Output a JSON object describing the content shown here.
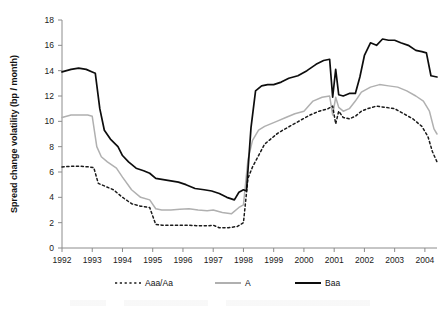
{
  "chart_data": {
    "type": "line",
    "title": "",
    "xlabel": "",
    "ylabel": "Spread change volatility (bp / month)",
    "xlim": [
      1992,
      2004.4
    ],
    "ylim": [
      0,
      18
    ],
    "grid": false,
    "legend_position": "bottom",
    "y_ticks": [
      0,
      2,
      4,
      6,
      8,
      10,
      12,
      14,
      16,
      18
    ],
    "y_tick_labels": [
      "0",
      "2",
      "4",
      "6",
      "8",
      "10",
      "12",
      "14",
      "16",
      "18"
    ],
    "x_ticks": [
      1992,
      1993,
      1994,
      1995,
      1996,
      1997,
      1998,
      1999,
      2000,
      2001,
      2002,
      2003,
      2004
    ],
    "x_tick_labels": [
      "1992",
      "1993",
      "1994",
      "1995",
      "1996",
      "1997",
      "1998",
      "1999",
      "2000",
      "2001",
      "2002",
      "2003",
      "2004"
    ],
    "series": [
      {
        "name": "Aaa/Aa",
        "style": "dotted",
        "color": "#1a1a1a",
        "x": [
          1992.0,
          1992.3,
          1992.6,
          1992.9,
          1993.05,
          1993.2,
          1993.4,
          1993.7,
          1994.0,
          1994.3,
          1994.6,
          1994.9,
          1995.1,
          1995.3,
          1995.6,
          1995.9,
          1996.2,
          1996.5,
          1996.8,
          1997.0,
          1997.2,
          1997.5,
          1997.8,
          1998.0,
          1998.15,
          1998.3,
          1998.5,
          1998.7,
          1998.9,
          1999.1,
          1999.3,
          1999.6,
          1999.9,
          2000.2,
          2000.5,
          2000.8,
          2000.95,
          2001.05,
          2001.15,
          2001.3,
          2001.5,
          2001.7,
          2001.9,
          2002.1,
          2002.4,
          2002.7,
          2003.0,
          2003.3,
          2003.6,
          2003.9,
          2004.1,
          2004.25,
          2004.4
        ],
        "y": [
          6.4,
          6.45,
          6.45,
          6.4,
          6.35,
          5.1,
          4.9,
          4.6,
          4.0,
          3.5,
          3.3,
          3.2,
          1.85,
          1.8,
          1.8,
          1.8,
          1.8,
          1.75,
          1.75,
          1.8,
          1.6,
          1.6,
          1.7,
          2.0,
          5.5,
          6.4,
          7.3,
          8.2,
          8.6,
          9.0,
          9.3,
          9.7,
          10.1,
          10.5,
          10.8,
          11.0,
          11.2,
          9.8,
          10.8,
          10.3,
          10.2,
          10.4,
          10.8,
          11.0,
          11.2,
          11.1,
          11.0,
          10.6,
          10.2,
          9.6,
          8.8,
          7.6,
          6.8
        ]
      },
      {
        "name": "A",
        "style": "solid",
        "color": "#b0b0b0",
        "x": [
          1992.0,
          1992.3,
          1992.6,
          1992.85,
          1993.0,
          1993.15,
          1993.3,
          1993.5,
          1993.8,
          1994.0,
          1994.3,
          1994.6,
          1994.9,
          1995.1,
          1995.3,
          1995.6,
          1995.9,
          1996.2,
          1996.5,
          1996.8,
          1997.0,
          1997.3,
          1997.6,
          1997.85,
          1998.0,
          1998.15,
          1998.3,
          1998.5,
          1998.7,
          1998.9,
          1999.1,
          1999.4,
          1999.7,
          2000.0,
          2000.3,
          2000.6,
          2000.85,
          2000.95,
          2001.05,
          2001.15,
          2001.3,
          2001.5,
          2001.7,
          2001.9,
          2002.2,
          2002.5,
          2002.8,
          2003.1,
          2003.4,
          2003.7,
          2003.95,
          2004.15,
          2004.3,
          2004.4
        ],
        "y": [
          10.3,
          10.5,
          10.5,
          10.5,
          10.4,
          8.0,
          7.2,
          6.8,
          6.3,
          5.6,
          4.6,
          4.0,
          3.8,
          3.1,
          3.0,
          3.0,
          3.05,
          3.1,
          3.0,
          2.95,
          3.0,
          2.8,
          2.7,
          3.2,
          3.4,
          7.0,
          8.5,
          9.3,
          9.6,
          9.8,
          10.0,
          10.3,
          10.6,
          10.8,
          11.6,
          11.9,
          12.0,
          10.5,
          11.9,
          11.1,
          10.8,
          11.0,
          11.6,
          12.3,
          12.7,
          12.9,
          12.8,
          12.7,
          12.4,
          12.0,
          11.6,
          10.8,
          9.4,
          9.0
        ]
      },
      {
        "name": "Baa",
        "style": "solid",
        "color": "#0d0d0d",
        "x": [
          1992.0,
          1992.3,
          1992.55,
          1992.8,
          1993.0,
          1993.1,
          1993.25,
          1993.4,
          1993.6,
          1993.85,
          1994.0,
          1994.2,
          1994.45,
          1994.7,
          1994.9,
          1995.1,
          1995.35,
          1995.6,
          1995.85,
          1996.1,
          1996.4,
          1996.7,
          1996.95,
          1997.2,
          1997.45,
          1997.7,
          1997.85,
          1998.0,
          1998.1,
          1998.25,
          1998.4,
          1998.6,
          1998.8,
          1999.0,
          1999.25,
          1999.5,
          1999.8,
          2000.1,
          2000.4,
          2000.65,
          2000.85,
          2000.95,
          2001.05,
          2001.15,
          2001.3,
          2001.5,
          2001.7,
          2001.85,
          2002.0,
          2002.2,
          2002.4,
          2002.6,
          2002.8,
          2003.0,
          2003.2,
          2003.45,
          2003.7,
          2003.9,
          2004.05,
          2004.2,
          2004.4
        ],
        "y": [
          13.9,
          14.1,
          14.2,
          14.1,
          13.9,
          13.8,
          11.0,
          9.3,
          8.6,
          8.0,
          7.3,
          6.8,
          6.3,
          6.1,
          5.9,
          5.5,
          5.4,
          5.3,
          5.2,
          5.0,
          4.7,
          4.6,
          4.5,
          4.3,
          4.0,
          3.8,
          4.4,
          4.6,
          4.5,
          9.5,
          12.4,
          12.8,
          12.9,
          12.9,
          13.1,
          13.4,
          13.6,
          14.0,
          14.5,
          14.8,
          14.9,
          11.9,
          14.1,
          12.1,
          12.0,
          12.2,
          12.2,
          13.5,
          15.2,
          16.2,
          16.0,
          16.5,
          16.4,
          16.4,
          16.2,
          16.0,
          15.6,
          15.5,
          15.4,
          13.6,
          13.5
        ]
      }
    ]
  },
  "legend": {
    "items": [
      {
        "label": "Aaa/Aa",
        "name": "legend-item-aaa-aa"
      },
      {
        "label": "A",
        "name": "legend-item-a"
      },
      {
        "label": "Baa",
        "name": "legend-item-baa"
      }
    ]
  }
}
